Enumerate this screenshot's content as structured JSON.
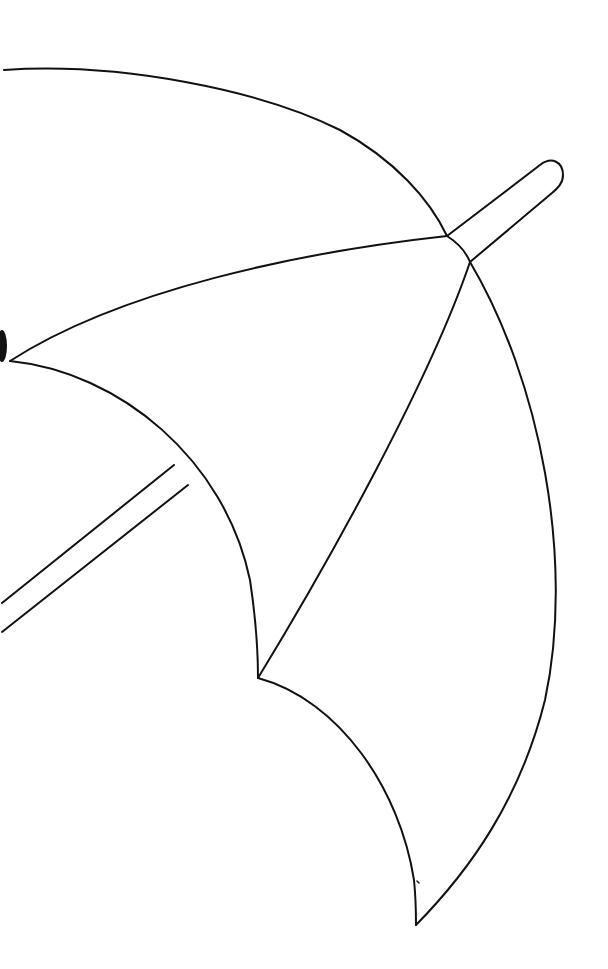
{
  "image": {
    "subject": "umbrella line drawing",
    "description": "Black outline of an open umbrella, tilted, with handle extending to upper right and shaft extending to lower left",
    "stroke_color": "#111111",
    "background_color": "#ffffff"
  }
}
